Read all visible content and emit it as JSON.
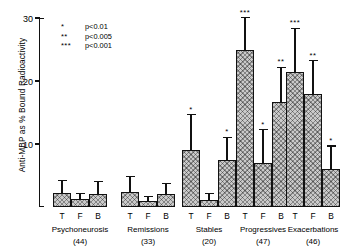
{
  "chart_data": {
    "type": "bar",
    "title": "",
    "xlabel": "",
    "ylabel": "Anti-MBP as % Bound Radioactivity",
    "ylim": [
      0,
      30
    ],
    "yticks": [
      0,
      10,
      20,
      30
    ],
    "ytick_labels": [
      "",
      "10",
      "20",
      "30"
    ],
    "grid": false,
    "legend_position": "top-left",
    "fraction_labels": [
      "T",
      "F",
      "B"
    ],
    "legend": [
      {
        "symbol": "*",
        "text": "p<0.01"
      },
      {
        "symbol": "**",
        "text": "p<0.005"
      },
      {
        "symbol": "***",
        "text": "p<0.001"
      }
    ],
    "categories": [
      "Psychoneurosis",
      "Remissions",
      "Stables",
      "Progressives",
      "Exacerbations"
    ],
    "counts": [
      "(44)",
      "(33)",
      "(20)",
      "(47)",
      "(46)"
    ],
    "series": [
      {
        "name": "T",
        "values": [
          2.2,
          2.4,
          9.0,
          25.0,
          21.5
        ]
      },
      {
        "name": "F",
        "values": [
          1.2,
          1.0,
          1.1,
          7.0,
          17.9
        ]
      },
      {
        "name": "B",
        "values": [
          2.0,
          2.0,
          7.4,
          16.6,
          6.0
        ]
      }
    ],
    "errors": [
      {
        "name": "T",
        "values": [
          1.9,
          2.3,
          5.6,
          5.0,
          6.8
        ]
      },
      {
        "name": "F",
        "values": [
          0.8,
          0.6,
          0.9,
          5.2,
          5.2
        ]
      },
      {
        "name": "B",
        "values": [
          2.0,
          1.6,
          3.6,
          5.5,
          3.6
        ]
      }
    ],
    "significance": [
      {
        "name": "T",
        "values": [
          "",
          "",
          "*",
          "***",
          "***"
        ]
      },
      {
        "name": "F",
        "values": [
          "",
          "",
          "",
          "*",
          "**"
        ]
      },
      {
        "name": "B",
        "values": [
          "",
          "",
          "*",
          "**",
          "*"
        ]
      }
    ]
  }
}
